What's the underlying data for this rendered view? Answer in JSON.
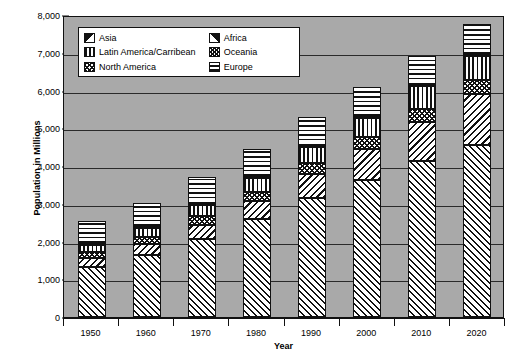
{
  "chart_data": {
    "type": "bar",
    "subtype": "stacked-bar",
    "title": "",
    "xlabel": "Year",
    "ylabel": "Population in Millions",
    "categories": [
      "1950",
      "1960",
      "1970",
      "1980",
      "1990",
      "2000",
      "2010",
      "2020"
    ],
    "ylim": [
      0,
      8000
    ],
    "ytick_values": [
      0,
      1000,
      2000,
      3000,
      4000,
      5000,
      6000,
      7000,
      8000
    ],
    "ytick_labels": [
      "0",
      "1,000",
      "2,000",
      "3,000",
      "4,000",
      "5,000",
      "6,000",
      "7,000",
      "8,000"
    ],
    "grid": true,
    "grid_axis": "y",
    "legend_position": "upper-left-inside",
    "stack_order_bottom_to_top": [
      "Asia",
      "Africa",
      "North America",
      "Latin America/Carribean",
      "Oceania",
      "Europe"
    ],
    "series": [
      {
        "name": "Asia",
        "pattern": "diagonal-up-hatch",
        "values": [
          1400,
          1700,
          2130,
          2640,
          3200,
          3690,
          4180,
          4600
        ]
      },
      {
        "name": "Africa",
        "pattern": "diagonal-down-hatch",
        "values": [
          230,
          290,
          370,
          480,
          640,
          810,
          1040,
          1340
        ]
      },
      {
        "name": "North America",
        "pattern": "checker-hatch",
        "values": [
          170,
          200,
          230,
          250,
          280,
          310,
          340,
          370
        ]
      },
      {
        "name": "Latin America/Carribean",
        "pattern": "vertical-lines",
        "values": [
          170,
          220,
          290,
          360,
          440,
          520,
          590,
          650
        ]
      },
      {
        "name": "Oceania",
        "pattern": "fine-cross-hatch",
        "values": [
          13,
          16,
          19,
          23,
          27,
          31,
          37,
          43
        ]
      },
      {
        "name": "Europe",
        "pattern": "horizontal-lines",
        "values": [
          549,
          605,
          657,
          693,
          721,
          727,
          738,
          747
        ]
      }
    ],
    "totals": [
      2532,
      3031,
      3696,
      4446,
      5308,
      6088,
      6925,
      7750
    ],
    "legend_columns": [
      [
        "Asia",
        "Latin America/Carribean",
        "North America"
      ],
      [
        "Africa",
        "Oceania",
        "Europe"
      ]
    ]
  },
  "legend": {
    "items_left": [
      {
        "label": "Asia",
        "swatch": "sw-asia",
        "icon": "asia-pattern-swatch"
      },
      {
        "label": "Latin America/Carribean",
        "swatch": "sw-latin",
        "icon": "latin-america-pattern-swatch"
      },
      {
        "label": "North America",
        "swatch": "sw-northam",
        "icon": "north-america-pattern-swatch"
      }
    ],
    "items_right": [
      {
        "label": "Africa",
        "swatch": "sw-africa",
        "icon": "africa-pattern-swatch"
      },
      {
        "label": "Oceania",
        "swatch": "sw-oceania",
        "icon": "oceania-pattern-swatch"
      },
      {
        "label": "Europe",
        "swatch": "sw-europe",
        "icon": "europe-pattern-swatch"
      }
    ]
  },
  "colors": {
    "plot_background": "#a9a9a9",
    "axis_line": "#111111",
    "gridline": "#2a2a2a",
    "page_background": "#ffffff",
    "pattern_ink": "#111111",
    "pattern_fill": "#ffffff"
  }
}
